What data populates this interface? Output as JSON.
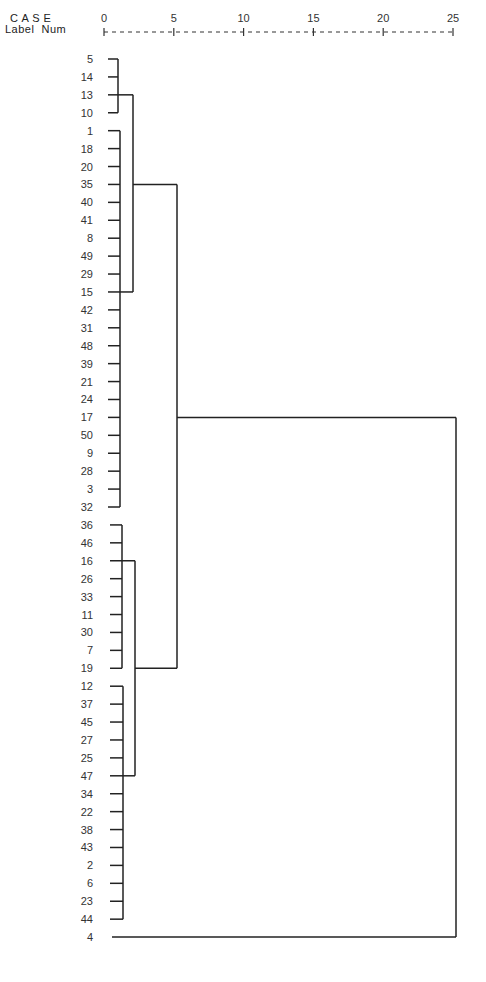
{
  "header": {
    "case_label": "C A S E",
    "label_num": "Label  Num"
  },
  "chart_data": {
    "type": "dendrogram",
    "title": "",
    "xlabel": "Rescaled Distance Cluster Combine",
    "axis_ticks": [
      0,
      5,
      10,
      15,
      20,
      25
    ],
    "xlim": [
      0,
      25
    ],
    "leaves": [
      "5",
      "14",
      "13",
      "10",
      "1",
      "18",
      "20",
      "35",
      "40",
      "41",
      "8",
      "49",
      "29",
      "15",
      "42",
      "31",
      "48",
      "39",
      "21",
      "24",
      "17",
      "50",
      "9",
      "28",
      "3",
      "32",
      "36",
      "46",
      "16",
      "26",
      "33",
      "11",
      "30",
      "7",
      "19",
      "12",
      "37",
      "45",
      "27",
      "25",
      "47",
      "34",
      "22",
      "38",
      "43",
      "2",
      "6",
      "23",
      "44",
      "4"
    ],
    "clusters": [
      {
        "id": "A",
        "leaves": [
          0,
          3
        ],
        "height": 1.0
      },
      {
        "id": "B",
        "leaves": [
          4,
          25
        ],
        "height": 1.1
      },
      {
        "id": "C",
        "children": [
          "A",
          "B"
        ],
        "join_row_top": 2,
        "join_row_bottom": 13,
        "height": 2.1
      },
      {
        "id": "D",
        "leaves": [
          26,
          34
        ],
        "height": 1.5
      },
      {
        "id": "E",
        "leaves": [
          35,
          48
        ],
        "height": 1.6
      },
      {
        "id": "F",
        "children": [
          "D",
          "E"
        ],
        "join_row_top": 28,
        "join_row_bottom": 40,
        "height": 2.2
      },
      {
        "id": "G",
        "children": [
          "C",
          "F"
        ],
        "join_row_top": 7,
        "join_row_bottom": 34,
        "height": 5.3
      },
      {
        "id": "H",
        "children": [
          "G",
          "leaf-4"
        ],
        "join_row_top": 20,
        "join_row_bottom": 49,
        "height": 25
      }
    ]
  }
}
